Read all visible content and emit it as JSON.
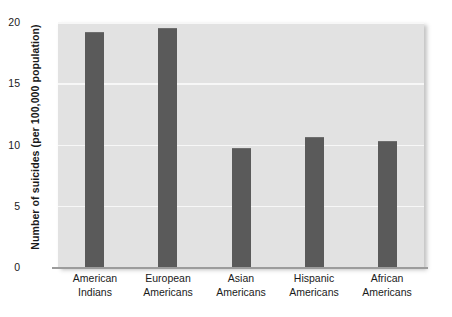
{
  "chart_data": {
    "type": "bar",
    "title": "",
    "xlabel": "",
    "ylabel": "Number of suicides (per 100,000 population)",
    "ylim": [
      0,
      20
    ],
    "yticks": [
      0,
      5,
      10,
      15,
      20
    ],
    "ytick_labels": [
      "0",
      "5",
      "10",
      "15",
      "20"
    ],
    "grid": true,
    "legend": "none",
    "categories": [
      "American Indians",
      "European Americans",
      "Asian Americans",
      "Hispanic Americans",
      "African Americans"
    ],
    "category_lines": [
      [
        "American",
        "Indians"
      ],
      [
        "European",
        "Americans"
      ],
      [
        "Asian",
        "Americans"
      ],
      [
        "Hispanic",
        "Americans"
      ],
      [
        "African",
        "Americans"
      ]
    ],
    "values": [
      19.1,
      19.4,
      9.6,
      10.5,
      10.2
    ],
    "colors": {
      "bar": "#5a5a5a",
      "plot_background": "#e2e2e2",
      "gridline": "#f7f7f7",
      "axis": "#9c9c9c",
      "text": "#1a1a1a",
      "page_background": "#ffffff"
    }
  }
}
